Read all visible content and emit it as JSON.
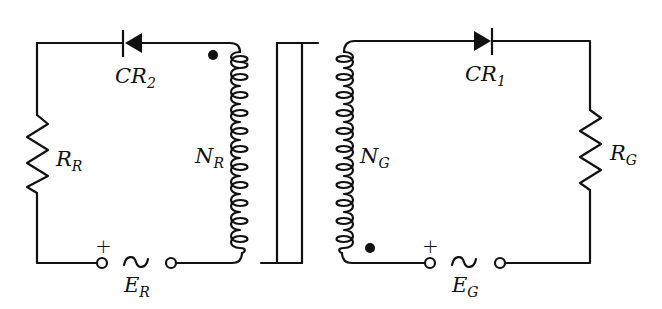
{
  "diagram": {
    "type": "transformer-circuit",
    "colors": {
      "stroke": "#111111",
      "background": "#ffffff"
    },
    "left_circuit": {
      "diode": {
        "label": "CR",
        "sub": "2",
        "direction": "left"
      },
      "resistor": {
        "label": "R",
        "sub": "R"
      },
      "winding": {
        "label": "N",
        "sub": "R",
        "polarity_dot": "top"
      },
      "source": {
        "label": "E",
        "sub": "R",
        "symbol": "~",
        "polarity": "+"
      }
    },
    "right_circuit": {
      "diode": {
        "label": "CR",
        "sub": "1",
        "direction": "right"
      },
      "resistor": {
        "label": "R",
        "sub": "G"
      },
      "winding": {
        "label": "N",
        "sub": "G",
        "polarity_dot": "bottom"
      },
      "source": {
        "label": "E",
        "sub": "G",
        "symbol": "~",
        "polarity": "+"
      }
    },
    "core": {
      "type": "laminated-core"
    }
  }
}
